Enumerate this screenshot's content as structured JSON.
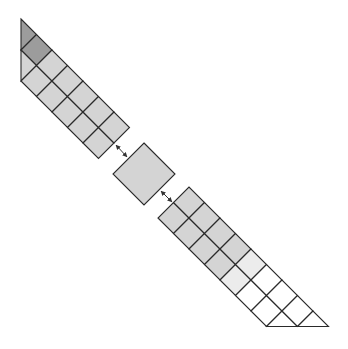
{
  "diagram": {
    "grid": {
      "origin_strip1": [
        21,
        81
      ],
      "origin_strip2": [
        158,
        218
      ],
      "step": 15.5
    },
    "colors": {
      "dark": "#9c9c9c",
      "grey": "#d4d4d4",
      "light": "#ececec",
      "white": "#ffffff",
      "stroke": "#2a2a2a"
    },
    "strip1": {
      "cells": [
        {
          "pts": [
            [
              -2,
              2
            ],
            [
              -1,
              2
            ],
            [
              -1,
              1
            ]
          ],
          "color": "dark"
        },
        {
          "pts": [
            [
              -1,
              1
            ],
            [
              0,
              1
            ],
            [
              0,
              2
            ],
            [
              -1,
              2
            ]
          ],
          "color": "dark"
        },
        {
          "pts": [
            [
              0,
              0
            ],
            [
              0,
              1
            ],
            [
              -1,
              1
            ]
          ],
          "color": "grey"
        },
        {
          "pts": [
            [
              0,
              0
            ],
            [
              1,
              0
            ],
            [
              1,
              1
            ],
            [
              0,
              1
            ]
          ],
          "color": "grey"
        },
        {
          "pts": [
            [
              0,
              1
            ],
            [
              1,
              1
            ],
            [
              1,
              2
            ],
            [
              0,
              2
            ]
          ],
          "color": "grey"
        },
        {
          "pts": [
            [
              1,
              0
            ],
            [
              2,
              0
            ],
            [
              2,
              1
            ],
            [
              1,
              1
            ]
          ],
          "color": "grey"
        },
        {
          "pts": [
            [
              1,
              1
            ],
            [
              2,
              1
            ],
            [
              2,
              2
            ],
            [
              1,
              2
            ]
          ],
          "color": "grey"
        },
        {
          "pts": [
            [
              2,
              0
            ],
            [
              3,
              0
            ],
            [
              3,
              1
            ],
            [
              2,
              1
            ]
          ],
          "color": "grey"
        },
        {
          "pts": [
            [
              2,
              1
            ],
            [
              3,
              1
            ],
            [
              3,
              2
            ],
            [
              2,
              2
            ]
          ],
          "color": "grey"
        },
        {
          "pts": [
            [
              3,
              0
            ],
            [
              4,
              0
            ],
            [
              4,
              1
            ],
            [
              3,
              1
            ]
          ],
          "color": "grey"
        },
        {
          "pts": [
            [
              3,
              1
            ],
            [
              4,
              1
            ],
            [
              4,
              2
            ],
            [
              3,
              2
            ]
          ],
          "color": "grey"
        },
        {
          "pts": [
            [
              4,
              0
            ],
            [
              5,
              0
            ],
            [
              5,
              1
            ],
            [
              4,
              1
            ]
          ],
          "color": "grey"
        },
        {
          "pts": [
            [
              4,
              1
            ],
            [
              5,
              1
            ],
            [
              5,
              2
            ],
            [
              4,
              2
            ]
          ],
          "color": "grey"
        }
      ]
    },
    "center_square": {
      "pts": [
        [
          144,
          143
        ],
        [
          175,
          174
        ],
        [
          144,
          205
        ],
        [
          113,
          174
        ]
      ],
      "color": "grey"
    },
    "strip2": {
      "cells": [
        {
          "pts": [
            [
              0,
              0
            ],
            [
              1,
              0
            ],
            [
              1,
              1
            ],
            [
              0,
              1
            ]
          ],
          "color": "grey"
        },
        {
          "pts": [
            [
              0,
              1
            ],
            [
              1,
              1
            ],
            [
              1,
              2
            ],
            [
              0,
              2
            ]
          ],
          "color": "grey"
        },
        {
          "pts": [
            [
              1,
              0
            ],
            [
              2,
              0
            ],
            [
              2,
              1
            ],
            [
              1,
              1
            ]
          ],
          "color": "grey"
        },
        {
          "pts": [
            [
              1,
              1
            ],
            [
              2,
              1
            ],
            [
              2,
              2
            ],
            [
              1,
              2
            ]
          ],
          "color": "grey"
        },
        {
          "pts": [
            [
              2,
              0
            ],
            [
              3,
              0
            ],
            [
              3,
              1
            ],
            [
              2,
              1
            ]
          ],
          "color": "grey"
        },
        {
          "pts": [
            [
              2,
              1
            ],
            [
              3,
              1
            ],
            [
              3,
              2
            ],
            [
              2,
              2
            ]
          ],
          "color": "grey"
        },
        {
          "pts": [
            [
              3,
              0
            ],
            [
              4,
              0
            ],
            [
              4,
              1
            ],
            [
              3,
              1
            ]
          ],
          "color": "grey"
        },
        {
          "pts": [
            [
              3,
              1
            ],
            [
              4,
              1
            ],
            [
              4,
              2
            ],
            [
              3,
              2
            ]
          ],
          "color": "grey"
        },
        {
          "pts": [
            [
              4,
              0
            ],
            [
              5,
              0
            ],
            [
              5,
              1
            ],
            [
              4,
              1
            ]
          ],
          "color": "light"
        },
        {
          "pts": [
            [
              4,
              1
            ],
            [
              5,
              1
            ],
            [
              5,
              2
            ],
            [
              4,
              2
            ]
          ],
          "color": "light"
        },
        {
          "pts": [
            [
              5,
              0
            ],
            [
              6,
              0
            ],
            [
              6,
              1
            ],
            [
              5,
              1
            ]
          ],
          "color": "white"
        },
        {
          "pts": [
            [
              5,
              1
            ],
            [
              6,
              1
            ],
            [
              6,
              2
            ],
            [
              5,
              2
            ]
          ],
          "color": "white"
        },
        {
          "pts": [
            [
              6,
              0
            ],
            [
              7,
              0
            ],
            [
              7,
              1
            ],
            [
              6,
              1
            ]
          ],
          "color": "white"
        },
        {
          "pts": [
            [
              6,
              1
            ],
            [
              7,
              1
            ],
            [
              7,
              2
            ],
            [
              6,
              2
            ]
          ],
          "color": "white"
        },
        {
          "pts": [
            [
              7,
              0
            ],
            [
              8,
              1
            ],
            [
              7,
              1
            ]
          ],
          "color": "white"
        },
        {
          "pts": [
            [
              7,
              1
            ],
            [
              8,
              1
            ],
            [
              8,
              2
            ],
            [
              7,
              2
            ]
          ],
          "color": "white"
        },
        {
          "pts": [
            [
              8,
              1
            ],
            [
              9,
              2
            ],
            [
              8,
              2
            ]
          ],
          "color": "white"
        }
      ]
    },
    "arrows": [
      {
        "from": [
          116,
          145
        ],
        "to": [
          127,
          157
        ],
        "type": "double-headed"
      },
      {
        "from": [
          161,
          191
        ],
        "to": [
          172,
          202
        ],
        "type": "double-headed"
      }
    ]
  }
}
